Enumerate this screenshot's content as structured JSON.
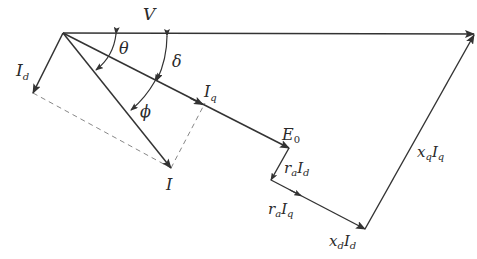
{
  "colors": {
    "line": "#333333",
    "dash": "#888888",
    "background": "#ffffff"
  },
  "labels": {
    "V": "V",
    "Id_main": "I",
    "Id_sub": "d",
    "theta": "θ",
    "delta": "δ",
    "phi": "ϕ",
    "Iq_main": "I",
    "Iq_sub": "q",
    "E0_main": "E",
    "E0_sub": "0",
    "I": "I",
    "raId_r": "r",
    "raId_a": "a",
    "raId_I": "I",
    "raId_d": "d",
    "raIq_r": "r",
    "raIq_a": "a",
    "raIq_I": "I",
    "raIq_q": "q",
    "xdId_x": "x",
    "xdId_d1": "d",
    "xdId_I": "I",
    "xdId_d2": "d",
    "xqIq_x": "x",
    "xqIq_q1": "q",
    "xqIq_I": "I",
    "xqIq_q2": "q"
  },
  "phasors": [
    {
      "name": "V",
      "from": [
        63,
        33
      ],
      "to": [
        474,
        34
      ]
    },
    {
      "name": "Id",
      "from": [
        63,
        33
      ],
      "to": [
        33,
        93
      ]
    },
    {
      "name": "I",
      "from": [
        63,
        33
      ],
      "to": [
        171,
        168
      ]
    },
    {
      "name": "E0 (along Iq)",
      "from": [
        63,
        33
      ],
      "to": [
        289,
        148
      ]
    },
    {
      "name": "ra*Id",
      "from": [
        289,
        148
      ],
      "to": [
        271,
        180
      ]
    },
    {
      "name": "ra*Iq + xd*Id",
      "from": [
        271,
        180
      ],
      "to": [
        365,
        229
      ]
    },
    {
      "name": "xq*Iq",
      "from": [
        365,
        229
      ],
      "to": [
        474,
        34
      ]
    }
  ]
}
